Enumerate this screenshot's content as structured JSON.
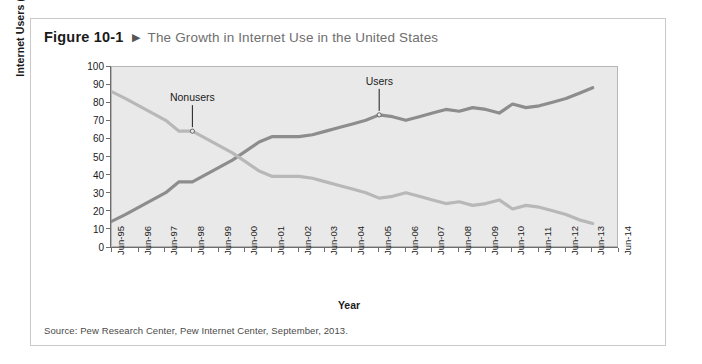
{
  "figure": {
    "number": "Figure 10-1",
    "arrow_glyph": "▶",
    "title": "The Growth in Internet Use in the United States",
    "source": "Source: Pew Research Center, Pew Internet Center, September, 2013."
  },
  "chart_data": {
    "type": "line",
    "title": "The Growth in Internet Use in the United States",
    "xlabel": "Year",
    "ylabel": "Internet Users (percentage)",
    "ylim": [
      0,
      100
    ],
    "ytick_step": 10,
    "yticks": [
      0,
      10,
      20,
      30,
      40,
      50,
      60,
      70,
      80,
      90,
      100
    ],
    "grid": false,
    "legend_position": "inline-annotations",
    "categories": [
      "Jun-95",
      "Jun-96",
      "Jun-97",
      "Jun-98",
      "Jun-99",
      "Jun-00",
      "Jun-01",
      "Jun-02",
      "Jun-03",
      "Jun-04",
      "Jun-05",
      "Jun-06",
      "Jun-07",
      "Jun-08",
      "Jun-09",
      "Jun-10",
      "Jun-11",
      "Jun-12",
      "Jun-13",
      "Jun-14"
    ],
    "xtick_labels": [
      "Jun-95",
      "Jun-96",
      "Jun-97",
      "Jun-98",
      "Jun-99",
      "Jun-00",
      "Jun-01",
      "Jun-02",
      "Jun-03",
      "Jun-04",
      "Jun-05",
      "Jun-06",
      "Jun-07",
      "Jun-08",
      "Jun-09",
      "Jun-10",
      "Jun-11",
      "Jun-12",
      "Jun-13",
      "Jun-14"
    ],
    "series": [
      {
        "name": "Users",
        "color": "#8d8d8d",
        "x": [
          1995.45,
          1996.0,
          1996.5,
          1997.0,
          1997.5,
          1998.0,
          1998.5,
          1999.0,
          1999.5,
          2000.0,
          2000.5,
          2001.0,
          2001.5,
          2002.0,
          2002.5,
          2003.0,
          2003.5,
          2004.0,
          2004.5,
          2005.0,
          2005.5,
          2006.0,
          2006.5,
          2007.0,
          2007.5,
          2008.0,
          2008.5,
          2009.0,
          2009.5,
          2010.0,
          2010.5,
          2011.0,
          2011.5,
          2012.0,
          2012.5,
          2013.0,
          2013.5
        ],
        "values": [
          14,
          18,
          22,
          26,
          30,
          36,
          36,
          40,
          44,
          48,
          53,
          58,
          61,
          61,
          61,
          62,
          64,
          66,
          68,
          70,
          73,
          72,
          70,
          72,
          74,
          76,
          75,
          77,
          76,
          74,
          79,
          77,
          78,
          80,
          82,
          85,
          88
        ]
      },
      {
        "name": "Nonusers",
        "color": "#b8b8b8",
        "x": [
          1995.45,
          1996.0,
          1996.5,
          1997.0,
          1997.5,
          1998.0,
          1998.5,
          1999.0,
          1999.5,
          2000.0,
          2000.5,
          2001.0,
          2001.5,
          2002.0,
          2002.5,
          2003.0,
          2003.5,
          2004.0,
          2004.5,
          2005.0,
          2005.5,
          2006.0,
          2006.5,
          2007.0,
          2007.5,
          2008.0,
          2008.5,
          2009.0,
          2009.5,
          2010.0,
          2010.5,
          2011.0,
          2011.5,
          2012.0,
          2012.5,
          2013.0,
          2013.5
        ],
        "values": [
          86,
          82,
          78,
          74,
          70,
          64,
          64,
          60,
          56,
          52,
          47,
          42,
          39,
          39,
          39,
          38,
          36,
          34,
          32,
          30,
          27,
          28,
          30,
          28,
          26,
          24,
          25,
          23,
          24,
          26,
          21,
          23,
          22,
          20,
          18,
          15,
          13
        ]
      }
    ],
    "annotations": [
      {
        "label": "Nonusers",
        "x": 1998.5,
        "y": 64
      },
      {
        "label": "Users",
        "x": 2005.5,
        "y": 73
      }
    ]
  }
}
